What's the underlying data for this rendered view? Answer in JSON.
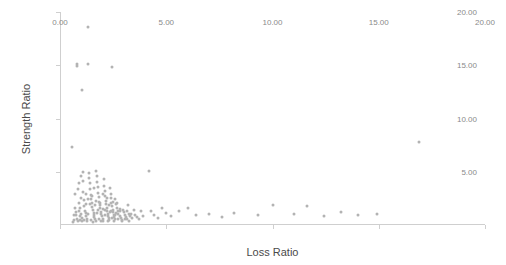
{
  "chart_data": {
    "type": "scatter",
    "title": "",
    "xlabel": "Loss Ratio",
    "ylabel": "Strength Ratio",
    "xlim": [
      0.0,
      20.0
    ],
    "ylim": [
      0.0,
      20.0
    ],
    "xticks": [
      "0.00",
      "5.00",
      "10.00",
      "15.00",
      "20.00"
    ],
    "xtick_values": [
      0.0,
      5.0,
      10.0,
      15.0,
      20.0
    ],
    "yticks": [
      "5.00",
      "10.00",
      "15.00",
      "20.00"
    ],
    "ytick_values": [
      5.0,
      10.0,
      15.0,
      20.0
    ],
    "grid": false,
    "legend": "none",
    "marker_color": "#b3b3b3",
    "axis_color": "#cfcfcf",
    "points": [
      [
        0.55,
        7.3
      ],
      [
        0.7,
        2.95
      ],
      [
        0.72,
        1.55
      ],
      [
        0.75,
        0.95
      ],
      [
        0.78,
        0.6
      ],
      [
        0.8,
        15.1
      ],
      [
        0.82,
        14.9
      ],
      [
        0.85,
        3.4
      ],
      [
        0.88,
        2.1
      ],
      [
        0.9,
        1.3
      ],
      [
        0.92,
        0.8
      ],
      [
        0.95,
        0.45
      ],
      [
        0.98,
        1.05
      ],
      [
        1.0,
        2.55
      ],
      [
        1.02,
        0.7
      ],
      [
        1.05,
        12.7
      ],
      [
        1.08,
        4.15
      ],
      [
        1.1,
        3.1
      ],
      [
        1.12,
        2.35
      ],
      [
        1.15,
        1.75
      ],
      [
        1.18,
        1.35
      ],
      [
        1.2,
        1.1
      ],
      [
        1.22,
        0.85
      ],
      [
        1.25,
        0.6
      ],
      [
        1.28,
        0.4
      ],
      [
        1.3,
        18.6
      ],
      [
        1.32,
        15.1
      ],
      [
        1.35,
        4.9
      ],
      [
        1.38,
        4.45
      ],
      [
        1.4,
        3.9
      ],
      [
        1.42,
        3.35
      ],
      [
        1.45,
        2.8
      ],
      [
        1.48,
        2.4
      ],
      [
        1.5,
        2.05
      ],
      [
        1.52,
        1.7
      ],
      [
        1.55,
        1.4
      ],
      [
        1.58,
        1.15
      ],
      [
        1.6,
        0.95
      ],
      [
        1.62,
        0.75
      ],
      [
        1.65,
        0.55
      ],
      [
        1.68,
        0.35
      ],
      [
        1.7,
        5.1
      ],
      [
        1.72,
        4.6
      ],
      [
        1.75,
        4.0
      ],
      [
        1.78,
        3.55
      ],
      [
        1.8,
        3.05
      ],
      [
        1.82,
        2.6
      ],
      [
        1.85,
        2.2
      ],
      [
        1.88,
        1.85
      ],
      [
        1.9,
        1.55
      ],
      [
        1.92,
        1.25
      ],
      [
        1.95,
        1.0
      ],
      [
        1.98,
        0.8
      ],
      [
        2.0,
        0.6
      ],
      [
        2.02,
        0.42
      ],
      [
        2.05,
        4.3
      ],
      [
        2.08,
        3.7
      ],
      [
        2.1,
        3.2
      ],
      [
        2.12,
        2.75
      ],
      [
        2.15,
        2.3
      ],
      [
        2.18,
        1.95
      ],
      [
        2.2,
        1.6
      ],
      [
        2.22,
        1.3
      ],
      [
        2.25,
        1.05
      ],
      [
        2.28,
        0.85
      ],
      [
        2.3,
        0.65
      ],
      [
        2.32,
        0.48
      ],
      [
        2.35,
        3.45
      ],
      [
        2.38,
        2.95
      ],
      [
        2.4,
        2.5
      ],
      [
        2.42,
        2.1
      ],
      [
        2.45,
        1.75
      ],
      [
        2.48,
        1.45
      ],
      [
        2.5,
        1.18
      ],
      [
        2.52,
        0.95
      ],
      [
        2.55,
        0.75
      ],
      [
        2.58,
        0.55
      ],
      [
        2.6,
        2.4
      ],
      [
        2.65,
        1.95
      ],
      [
        2.7,
        1.6
      ],
      [
        2.72,
        1.3
      ],
      [
        2.75,
        1.05
      ],
      [
        2.8,
        0.85
      ],
      [
        2.85,
        0.65
      ],
      [
        2.9,
        0.5
      ],
      [
        2.95,
        1.45
      ],
      [
        3.0,
        1.2
      ],
      [
        3.05,
        0.95
      ],
      [
        3.1,
        0.78
      ],
      [
        3.15,
        0.6
      ],
      [
        3.2,
        1.9
      ],
      [
        3.25,
        1.05
      ],
      [
        3.3,
        0.85
      ],
      [
        3.4,
        0.68
      ],
      [
        3.5,
        1.45
      ],
      [
        3.55,
        0.95
      ],
      [
        3.6,
        0.72
      ],
      [
        3.7,
        0.55
      ],
      [
        3.8,
        1.3
      ],
      [
        3.9,
        0.8
      ],
      [
        2.45,
        14.85
      ],
      [
        4.2,
        5.05
      ],
      [
        4.3,
        1.3
      ],
      [
        4.4,
        0.95
      ],
      [
        4.6,
        0.7
      ],
      [
        4.8,
        1.55
      ],
      [
        5.0,
        1.1
      ],
      [
        5.2,
        0.8
      ],
      [
        5.6,
        1.35
      ],
      [
        6.0,
        1.55
      ],
      [
        6.4,
        0.9
      ],
      [
        7.0,
        1.05
      ],
      [
        7.6,
        0.75
      ],
      [
        8.2,
        1.15
      ],
      [
        9.3,
        0.95
      ],
      [
        10.0,
        1.9
      ],
      [
        11.0,
        1.05
      ],
      [
        11.6,
        1.8
      ],
      [
        12.4,
        0.85
      ],
      [
        13.2,
        1.2
      ],
      [
        14.0,
        0.95
      ],
      [
        14.9,
        1.0
      ],
      [
        16.9,
        7.75
      ],
      [
        0.6,
        0.3
      ],
      [
        0.65,
        0.5
      ],
      [
        0.68,
        0.95
      ],
      [
        0.74,
        1.25
      ],
      [
        0.86,
        0.35
      ],
      [
        0.94,
        1.55
      ],
      [
        1.04,
        0.35
      ],
      [
        1.14,
        0.5
      ],
      [
        1.24,
        1.95
      ],
      [
        1.34,
        1.05
      ],
      [
        1.44,
        0.5
      ],
      [
        1.54,
        0.32
      ],
      [
        1.64,
        1.9
      ],
      [
        1.74,
        1.1
      ],
      [
        1.84,
        0.52
      ],
      [
        1.94,
        0.34
      ],
      [
        2.04,
        1.5
      ],
      [
        2.14,
        0.95
      ],
      [
        2.24,
        0.42
      ],
      [
        2.34,
        1.2
      ],
      [
        2.44,
        0.62
      ],
      [
        2.54,
        0.38
      ],
      [
        2.64,
        1.1
      ],
      [
        2.74,
        0.52
      ],
      [
        2.84,
        1.3
      ],
      [
        2.94,
        0.36
      ],
      [
        3.04,
        0.54
      ],
      [
        3.14,
        1.35
      ],
      [
        3.24,
        0.42
      ],
      [
        3.34,
        1.0
      ],
      [
        0.9,
        3.95
      ],
      [
        1.0,
        4.6
      ],
      [
        1.1,
        5.0
      ],
      [
        1.2,
        2.9
      ],
      [
        1.3,
        2.4
      ],
      [
        1.4,
        1.95
      ],
      [
        1.5,
        2.7
      ],
      [
        1.6,
        3.5
      ],
      [
        1.7,
        2.25
      ],
      [
        1.8,
        1.4
      ],
      [
        1.9,
        2.05
      ],
      [
        2.0,
        2.9
      ],
      [
        2.1,
        1.45
      ],
      [
        2.2,
        2.55
      ],
      [
        2.3,
        1.85
      ],
      [
        2.4,
        1.35
      ],
      [
        2.5,
        2.2
      ],
      [
        2.6,
        0.95
      ],
      [
        2.7,
        2.05
      ],
      [
        2.8,
        1.5
      ]
    ]
  }
}
